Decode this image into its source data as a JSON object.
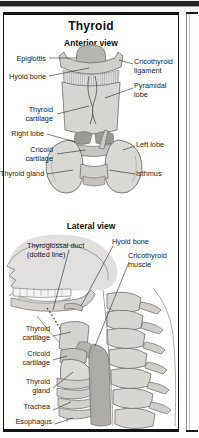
{
  "page": {
    "title": "Thyroid",
    "sections": [
      {
        "id": "anterior",
        "heading": "Anterior view"
      },
      {
        "id": "lateral",
        "heading": "Lateral view"
      }
    ]
  },
  "anterior_labels": {
    "epiglottis": "Epiglottis",
    "hyoid_bone": "Hyoid bone",
    "cricothyroid_ligament": "Cricothyroid\nligament",
    "pyramidal_lobe": "Pyramidal\nlobe",
    "thyroid_cartilage": "Thyroid\ncartilage",
    "right_lobe": "Right lobe",
    "left_lobe": "Left lobe",
    "cricoid_cartilage": "Cricoid\ncartilage",
    "thyroid_gland": "Thyroid gland",
    "isthmus": "Isthmus"
  },
  "lateral_labels": {
    "thyroglossal_duct": "Thyroglossal duct\n(dotted line)",
    "hyoid_bone": "Hyoid bone",
    "cricothyroid_muscle": "Cricothyroid\nmuscle",
    "thyroid_cartilage": "Thyroid\ncartilage",
    "cricoid_cartilage": "Cricoid\ncartilage",
    "thyroid_gland": "Thyroid\ngland",
    "trachea": "Trachea",
    "esophagus": "Esophagus"
  },
  "colors": {
    "ink": "#1b1b1b",
    "frame": "#141414",
    "page": "#ffffff",
    "tissue_light": "#dedddb",
    "tissue_mid": "#c9c8c5",
    "tissue_dark": "#a9a8a5",
    "outline": "#6f6e6c"
  }
}
